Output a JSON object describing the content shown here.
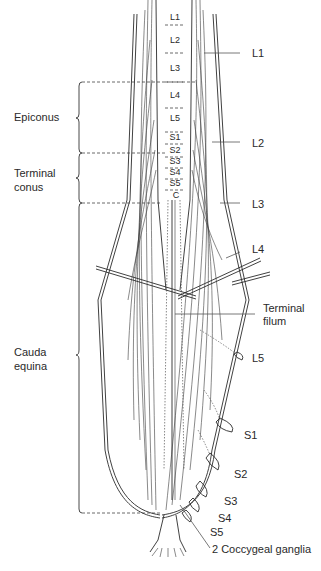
{
  "figure": {
    "cord_segment_labels": [
      {
        "text": "L1",
        "x": 175,
        "y": 20
      },
      {
        "text": "L2",
        "x": 175,
        "y": 43
      },
      {
        "text": "L3",
        "x": 175,
        "y": 71
      },
      {
        "text": "L4",
        "x": 175,
        "y": 98
      },
      {
        "text": "L5",
        "x": 175,
        "y": 121
      },
      {
        "text": "S1",
        "x": 175,
        "y": 140
      },
      {
        "text": "S2",
        "x": 175,
        "y": 153
      },
      {
        "text": "S3",
        "x": 175,
        "y": 164
      },
      {
        "text": "S4",
        "x": 175,
        "y": 175
      },
      {
        "text": "S5",
        "x": 175,
        "y": 186
      },
      {
        "text": "C",
        "x": 176,
        "y": 198
      }
    ],
    "root_labels": [
      {
        "text": "L1",
        "x": 252,
        "y": 57
      },
      {
        "text": "L2",
        "x": 252,
        "y": 147
      },
      {
        "text": "L3",
        "x": 252,
        "y": 208
      },
      {
        "text": "L4",
        "x": 252,
        "y": 253
      },
      {
        "text": "L5",
        "x": 252,
        "y": 362
      },
      {
        "text": "S1",
        "x": 244,
        "y": 439
      },
      {
        "text": "S2",
        "x": 234,
        "y": 478
      },
      {
        "text": "S3",
        "x": 224,
        "y": 505
      },
      {
        "text": "S4",
        "x": 218,
        "y": 522
      },
      {
        "text": "S5",
        "x": 210,
        "y": 536
      }
    ],
    "filum_label": {
      "line1": "Terminal",
      "line2": "filum",
      "x": 263,
      "y": 312
    },
    "ganglia_label": {
      "text": "2 Coccygeal ganglia",
      "x": 212,
      "y": 553
    },
    "regions": [
      {
        "name": "epiconus",
        "line1": "Epiconus",
        "line2": "",
        "x": 14,
        "y": 121
      },
      {
        "name": "terminal-conus",
        "line1": "Terminal",
        "line2": "conus",
        "x": 14,
        "y": 177
      },
      {
        "name": "cauda-equina",
        "line1": "Cauda",
        "line2": "equina",
        "x": 14,
        "y": 356
      }
    ]
  }
}
